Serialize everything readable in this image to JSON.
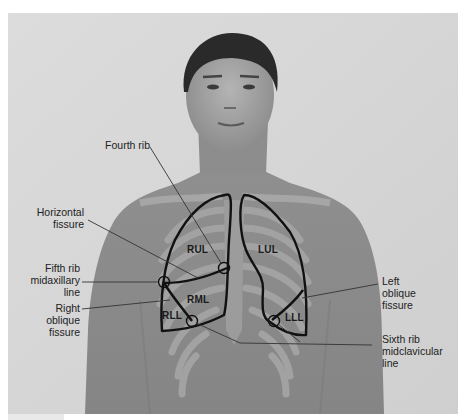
{
  "figure": {
    "background_color": "#d6d6d6",
    "rib_shading_color": "#9a9a9a",
    "outline_color": "#111111",
    "labels": {
      "fourth_rib": [
        "Fourth rib"
      ],
      "horizontal_fissure": [
        "Horizontal",
        "fissure"
      ],
      "fifth_rib": [
        "Fifth rib",
        "midaxillary",
        "line"
      ],
      "right_oblique": [
        "Right",
        "oblique",
        "fissure"
      ],
      "left_oblique": [
        "Left",
        "oblique",
        "fissure"
      ],
      "sixth_rib": [
        "Sixth rib",
        "midclavicular",
        "line"
      ]
    },
    "lobes": {
      "rul": "RUL",
      "rml": "RML",
      "rll": "RLL",
      "lul": "LUL",
      "lll": "LLL"
    }
  }
}
